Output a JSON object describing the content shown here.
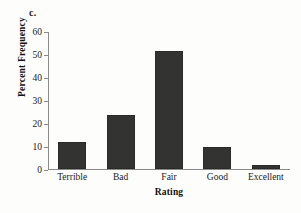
{
  "figure": {
    "panel_label": "c.",
    "background_color": "#fdfdfc"
  },
  "chart_data": {
    "type": "bar",
    "title": "",
    "subtitle": "",
    "categories": [
      "Terrible",
      "Bad",
      "Fair",
      "Good",
      "Excellent"
    ],
    "values": [
      12,
      23.5,
      51.5,
      9.7,
      1.7
    ],
    "xlabel": "Rating",
    "ylabel": "Percent Frequency",
    "ylim": [
      0,
      60
    ],
    "yticks": [
      0,
      10,
      20,
      30,
      40,
      50,
      60
    ],
    "ytick_labels": [
      "0",
      "10",
      "20",
      "30",
      "40",
      "50",
      "60"
    ],
    "grid": false,
    "legend": false,
    "bar_color": "#333331",
    "axis_color": "#8a8a88"
  }
}
